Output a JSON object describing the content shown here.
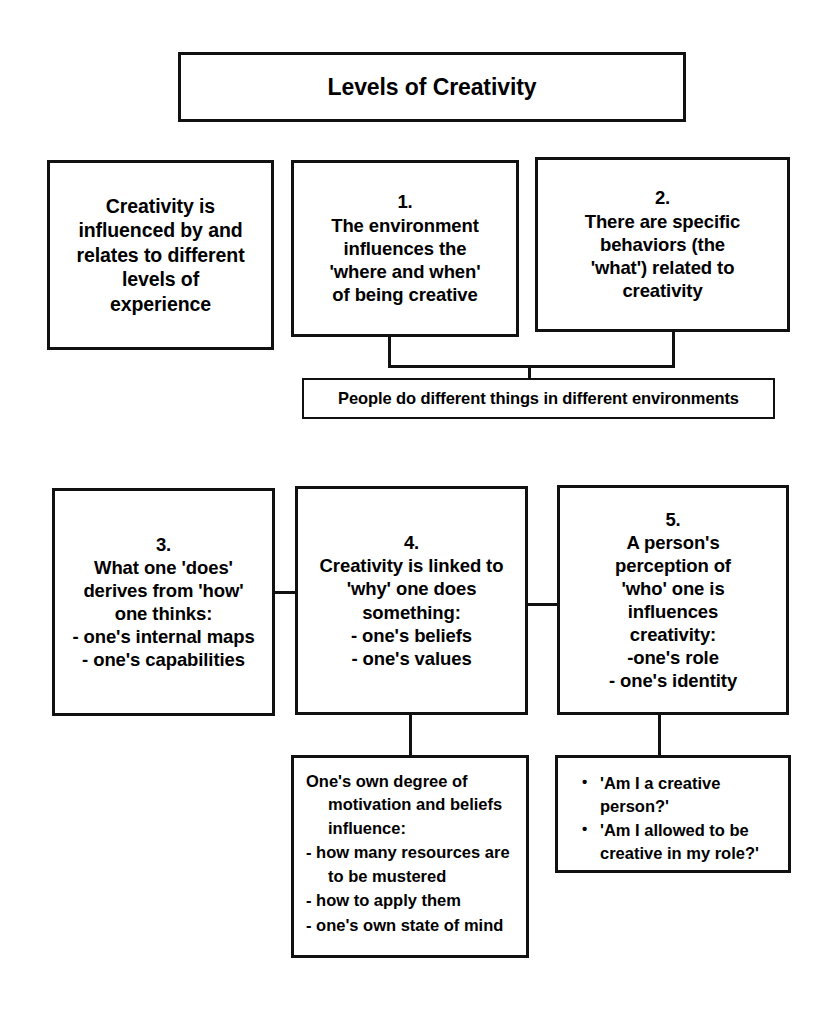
{
  "diagram": {
    "title": "Levels of Creativity",
    "intro": {
      "lines": [
        "Creativity is",
        "influenced by and",
        "relates to different",
        "levels of",
        "experience"
      ]
    },
    "level1": {
      "number": "1.",
      "lines": [
        "1.",
        "The environment",
        "influences the",
        "'where and when'",
        "of being creative"
      ]
    },
    "level2": {
      "number": "2.",
      "lines": [
        "2.",
        "There are specific",
        "behaviors (the",
        "'what') related to",
        "creativity"
      ]
    },
    "people": {
      "text": "People do different things in different environments"
    },
    "level3": {
      "number": "3.",
      "lines": [
        "3.",
        "What one 'does'",
        "derives from 'how'",
        "one thinks:",
        "- one's internal maps",
        "- one's capabilities"
      ]
    },
    "level4": {
      "number": "4.",
      "lines": [
        "4.",
        "Creativity is linked to",
        "'why' one does",
        "something:",
        "- one's beliefs",
        "- one's values"
      ]
    },
    "level5": {
      "number": "5.",
      "lines": [
        "5.",
        "A person's",
        "perception of",
        "'who' one is",
        "influences",
        "creativity:",
        "-one's role",
        "- one's identity"
      ]
    },
    "influence": {
      "paragraphs": [
        "One's own degree of motivation and beliefs influence:",
        "- how many resources are to be mustered",
        "- how to apply them",
        "- one's own state of mind"
      ]
    },
    "questions": {
      "bullet_glyph": "•",
      "items": [
        "'Am I a creative person?'",
        "'Am I allowed to be creative in my role?'"
      ]
    }
  }
}
